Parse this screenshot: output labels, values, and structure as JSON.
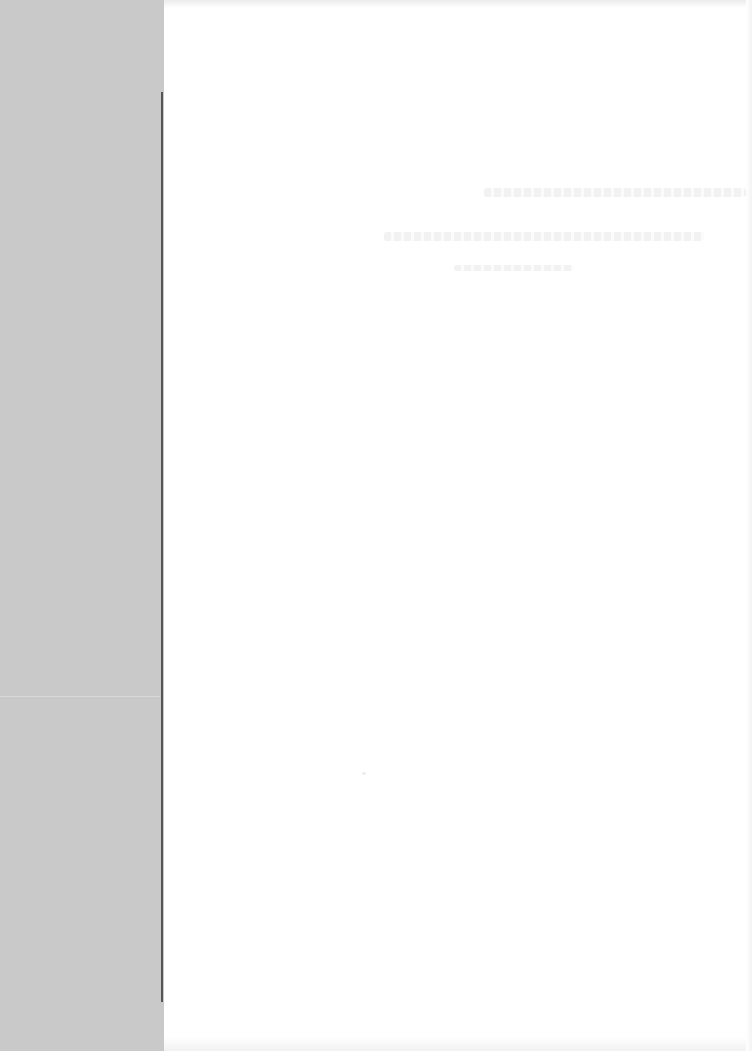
{
  "page": {
    "type": "faded scanned document page",
    "sidebar_color": "#c9c9c9",
    "rule_color": "#555555",
    "background_color": "#ffffff"
  },
  "main": {
    "ghost_text_lines": [
      {
        "text": "",
        "note": "illegible faint text line"
      },
      {
        "text": "",
        "note": "illegible faint text line"
      },
      {
        "text": "",
        "note": "illegible faint text line"
      }
    ]
  }
}
